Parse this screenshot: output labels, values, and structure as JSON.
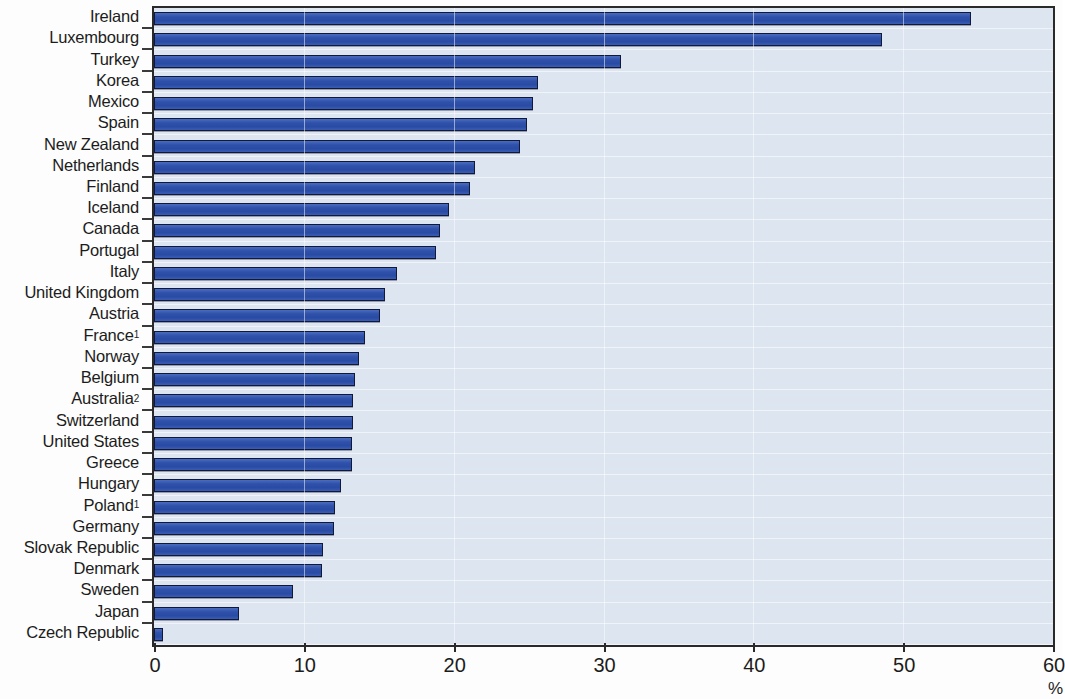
{
  "chart_data": {
    "type": "bar",
    "orientation": "horizontal",
    "title": "",
    "xlabel": "%",
    "ylabel": "",
    "xlim": [
      0,
      60
    ],
    "xticks": [
      0,
      10,
      20,
      30,
      40,
      50,
      60
    ],
    "xtick_labels": [
      "0",
      "10",
      "20",
      "30",
      "40",
      "50",
      "60"
    ],
    "grid": true,
    "legend": "none",
    "bar_color": "#2f51aa",
    "bar_edge_color": "#101a38",
    "plot_background": "#dde5f0",
    "categories": [
      "Ireland",
      "Luxembourg",
      "Turkey",
      "Korea",
      "Mexico",
      "Spain",
      "New Zealand",
      "Netherlands",
      "Finland",
      "Iceland",
      "Canada",
      "Portugal",
      "Italy",
      "United Kingdom",
      "Austria",
      "France",
      "Norway",
      "Belgium",
      "Australia",
      "Switzerland",
      "United States",
      "Greece",
      "Hungary",
      "Poland",
      "Germany",
      "Slovak Republic",
      "Denmark",
      "Sweden",
      "Japan",
      "Czech Republic"
    ],
    "category_footnotes": {
      "France": "1",
      "Australia": "2",
      "Poland": "1"
    },
    "values": [
      54.5,
      48.6,
      31.2,
      25.6,
      25.3,
      24.9,
      24.4,
      21.4,
      21.1,
      19.7,
      19.1,
      18.8,
      16.2,
      15.4,
      15.1,
      14.1,
      13.7,
      13.4,
      13.3,
      13.3,
      13.2,
      13.2,
      12.5,
      12.1,
      12.0,
      11.3,
      11.2,
      9.3,
      5.7,
      0.6
    ]
  }
}
